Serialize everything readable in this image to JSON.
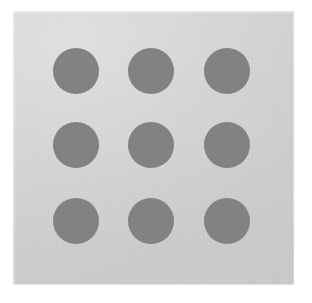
{
  "figure": {
    "page_background": "#ffffff",
    "panel": {
      "background": "#d2d2d2",
      "x": 13,
      "y": 11,
      "width": 281,
      "height": 274
    },
    "dot": {
      "fill": "#828282",
      "diameter": 46,
      "count": 9,
      "rows": 3,
      "columns": 3
    },
    "row_centers_y": [
      71,
      145,
      221
    ],
    "column_centers_x": [
      76,
      151,
      227
    ]
  },
  "chart_data": {
    "type": "scatter",
    "title": "",
    "xlabel": "",
    "ylabel": "",
    "grid": false,
    "legend_position": "none",
    "marker": {
      "shape": "circle",
      "color": "#828282",
      "diameter_px": 46
    },
    "x": [
      76,
      151,
      227,
      76,
      151,
      227,
      76,
      151,
      227
    ],
    "y": [
      71,
      71,
      71,
      145,
      145,
      145,
      221,
      221,
      221
    ],
    "xlim": [
      13,
      294
    ],
    "ylim": [
      11,
      285
    ],
    "points": [
      {
        "label": "top-left",
        "row": 1,
        "column": 1,
        "cx": 76,
        "cy": 71,
        "r": 23
      },
      {
        "label": "top-center",
        "row": 1,
        "column": 2,
        "cx": 151,
        "cy": 71,
        "r": 23
      },
      {
        "label": "top-right",
        "row": 1,
        "column": 3,
        "cx": 227,
        "cy": 71,
        "r": 23
      },
      {
        "label": "middle-left",
        "row": 2,
        "column": 1,
        "cx": 76,
        "cy": 145,
        "r": 23
      },
      {
        "label": "middle-center",
        "row": 2,
        "column": 2,
        "cx": 151,
        "cy": 145,
        "r": 23
      },
      {
        "label": "middle-right",
        "row": 2,
        "column": 3,
        "cx": 227,
        "cy": 145,
        "r": 23
      },
      {
        "label": "bottom-left",
        "row": 3,
        "column": 1,
        "cx": 76,
        "cy": 221,
        "r": 23
      },
      {
        "label": "bottom-center",
        "row": 3,
        "column": 2,
        "cx": 151,
        "cy": 221,
        "r": 23
      },
      {
        "label": "bottom-right",
        "row": 3,
        "column": 3,
        "cx": 227,
        "cy": 221,
        "r": 23
      }
    ]
  }
}
